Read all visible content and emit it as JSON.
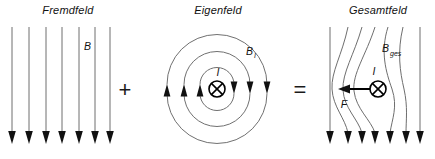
{
  "figure": {
    "kind": "physics-diagram",
    "background_color": "#ffffff",
    "line_color": "#6e6e6e",
    "ink_color": "#111111",
    "width": 435,
    "height": 159
  },
  "panels": [
    {
      "id": "fremdfeld",
      "title": "Fremdfeld",
      "title_x": 68,
      "title_y": 14,
      "field_label": "B",
      "field_label_x": 84,
      "field_label_y": 50,
      "line_count": 7,
      "line_x": [
        12,
        29,
        46,
        62,
        79,
        95,
        110
      ],
      "line_top": 27,
      "line_bottom": 140,
      "direction": "down"
    },
    {
      "id": "eigenfeld",
      "title": "Eigenfeld",
      "title_x": 218,
      "title_y": 14,
      "field_label": "B",
      "field_label_sub": "I",
      "field_label_x": 250,
      "field_label_y": 55,
      "current_label": "I",
      "current_label_x": 218,
      "current_label_y": 74,
      "center_x": 217,
      "center_y": 89,
      "radii": [
        17,
        33,
        50
      ],
      "wire_radius": 8,
      "current_direction": "into-page",
      "circulation": "clockwise"
    },
    {
      "id": "gesamtfeld",
      "title": "Gesamtfeld",
      "title_x": 378,
      "title_y": 14,
      "field_label": "B",
      "field_label_sub": "ges",
      "field_label_x": 386,
      "field_label_y": 52,
      "current_label": "I",
      "current_label_x": 375,
      "current_label_y": 73,
      "force_label": "F",
      "force_label_x": 344,
      "force_label_y": 106,
      "wire_x": 378,
      "wire_y": 89,
      "wire_radius": 8,
      "current_direction": "into-page",
      "force_direction": "left",
      "force_arrow_from_x": 372,
      "force_arrow_to_x": 340,
      "force_arrow_y": 89,
      "line_count": 7,
      "line_top": 27,
      "line_bottom": 140,
      "line_top_x": [
        330,
        348,
        362,
        375,
        388,
        403,
        420
      ],
      "line_bottom_x": [
        330,
        348,
        362,
        375,
        390,
        406,
        420
      ]
    }
  ],
  "operators": [
    {
      "symbol": "+",
      "x": 125,
      "y": 97,
      "name": "plus-operator"
    },
    {
      "symbol": "=",
      "x": 300,
      "y": 97,
      "name": "equals-operator"
    }
  ]
}
